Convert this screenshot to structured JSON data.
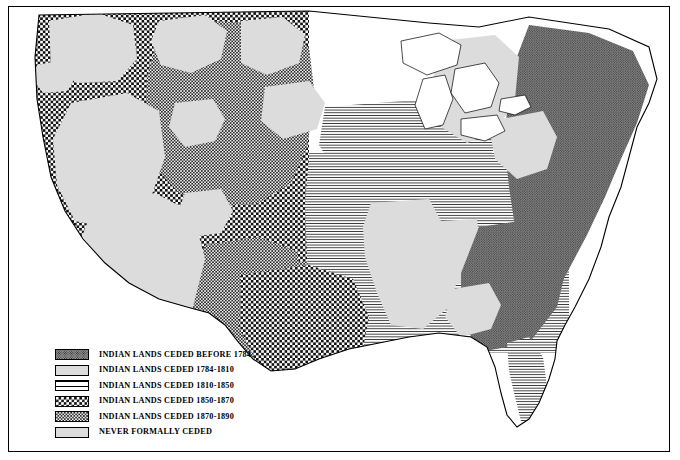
{
  "map": {
    "title": "Indian Land Cessions in the United States",
    "subject": "contiguous-united-states",
    "frame_color": "#000000",
    "background_color": "#ffffff",
    "outline_color": "#000000"
  },
  "legend": {
    "name": "map-legend",
    "items": [
      {
        "key": "before-1784",
        "label": "INDIAN LANDS CEDED BEFORE 1784",
        "pattern": "dense-stipple",
        "swatch_class": "sw-before1784",
        "fill_color": "#8d8d8d"
      },
      {
        "key": "1784-1810",
        "label": "INDIAN LANDS CEDED 1784-1810",
        "pattern": "solid-light-gray",
        "swatch_class": "sw-1784-1810",
        "fill_color": "#dcdcdc"
      },
      {
        "key": "1810-1850",
        "label": "INDIAN LANDS CEDED 1810-1850",
        "pattern": "horizontal-lines",
        "swatch_class": "sw-1810-1850",
        "fill_color": "#ffffff"
      },
      {
        "key": "1850-1870",
        "label": "INDIAN LANDS CEDED 1850-1870",
        "pattern": "bold-checkerboard",
        "swatch_class": "sw-1850-1870",
        "fill_color": "#ffffff"
      },
      {
        "key": "1870-1890",
        "label": "INDIAN LANDS CEDED 1870-1890",
        "pattern": "fine-checkerboard",
        "swatch_class": "sw-1870-1890",
        "fill_color": "#e8e8e8"
      },
      {
        "key": "never-ceded",
        "label": "NEVER FORMALLY CEDED",
        "pattern": "solid-light-gray",
        "swatch_class": "sw-never",
        "fill_color": "#dcdcdc"
      }
    ]
  },
  "regions": [
    {
      "name": "eastern-seaboard",
      "category": "before-1784"
    },
    {
      "name": "ohio-valley-great-lakes",
      "category": "1810-1850"
    },
    {
      "name": "florida-peninsula",
      "category": "1810-1850"
    },
    {
      "name": "great-plains",
      "category": "1810-1850"
    },
    {
      "name": "texas-southwest",
      "category": "1850-1870"
    },
    {
      "name": "pacific-coast",
      "category": "1850-1870"
    },
    {
      "name": "northern-rockies",
      "category": "1850-1870"
    },
    {
      "name": "great-basin",
      "category": "1870-1890"
    },
    {
      "name": "arizona-new-mexico",
      "category": "1870-1890"
    },
    {
      "name": "dakota-territory",
      "category": "1870-1890"
    },
    {
      "name": "appalachian-piedmont",
      "category": "1784-1810"
    },
    {
      "name": "unceded-reservations",
      "category": "never-ceded"
    }
  ]
}
